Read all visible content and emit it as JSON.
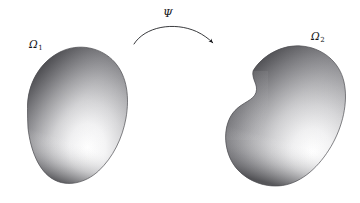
{
  "figure": {
    "type": "mathematical-diagram",
    "background_color": "#ffffff",
    "ink_color": "#15161a"
  },
  "labels": {
    "left_domain": {
      "symbol": "Ω",
      "subscript": "1",
      "text": "Ω₁"
    },
    "right_domain": {
      "symbol": "Ω",
      "subscript": "2",
      "text": "Ω₂"
    },
    "mapping": {
      "symbol": "Ψ",
      "text": "Ψ"
    }
  },
  "shapes": {
    "left_domain": {
      "name": "omega-1-blob",
      "outline_path": "M 27.5 108.5 C 27.0 84.0 40.0 62.0 60.0 52.0 C 79.0 42.5 101.5 47.5 114.5 62.0 C 127.5 76.5 129.5 98.0 126.0 118.0 C 122.5 138.0 113.0 157.5 98.5 171.0 C 85.0 183.5 67.0 187.0 53.5 179.5 C 38.5 171.0 30.5 150.0 28.0 128.0 C 27.6 121.5 27.5 114.8 27.5 108.5 Z",
      "fill_gradient": {
        "type": "radial",
        "highlight_center": [
          88,
          150
        ],
        "highlight_color": "#ffffff",
        "mid_color": "#b9b9bb",
        "shadow_color": "#4a4a4d",
        "rim_shadow_color": "#2b2b2e"
      },
      "bounds": {
        "x": 27,
        "y": 46,
        "width": 102,
        "height": 140
      }
    },
    "right_domain": {
      "name": "omega-2-blob",
      "outline_path": "M 253.0 71.0 C 264.0 55.0 284.0 44.5 304.0 46.5 C 324.0 48.5 340.5 63.5 344.5 84.5 C 348.5 105.5 341.0 129.0 329.0 148.5 C 317.0 168.0 300.0 183.5 280.0 185.5 C 260.0 187.5 240.0 176.5 231.0 159.5 C 222.0 142.5 224.5 122.5 235.5 110.5 C 244.0 101.0 254.0 99.5 256.5 92.0 C 259.0 84.5 252.0 79.0 253.0 71.0 Z",
      "notch": {
        "description": "concave indentation on the left flank",
        "apex": [
          252,
          94
        ]
      },
      "fill_gradient": {
        "type": "radial",
        "highlight_center": [
          312,
          150
        ],
        "highlight_color": "#ffffff",
        "mid_color": "#b9b9bb",
        "shadow_color": "#4a4a4d",
        "rim_shadow_color": "#2b2b2e"
      },
      "bounds": {
        "x": 223,
        "y": 45,
        "width": 123,
        "height": 142
      }
    },
    "arrow": {
      "name": "mapping-arrow",
      "path": "M 134 44 C 146 27 175 22 197 32 C 203.5 35 208.5 38.5 212.5 42.5",
      "start": [
        134,
        44
      ],
      "end": [
        213,
        43
      ],
      "arrowhead": [
        214,
        44
      ],
      "stroke_width": 0.8,
      "color": "#15161a"
    }
  }
}
